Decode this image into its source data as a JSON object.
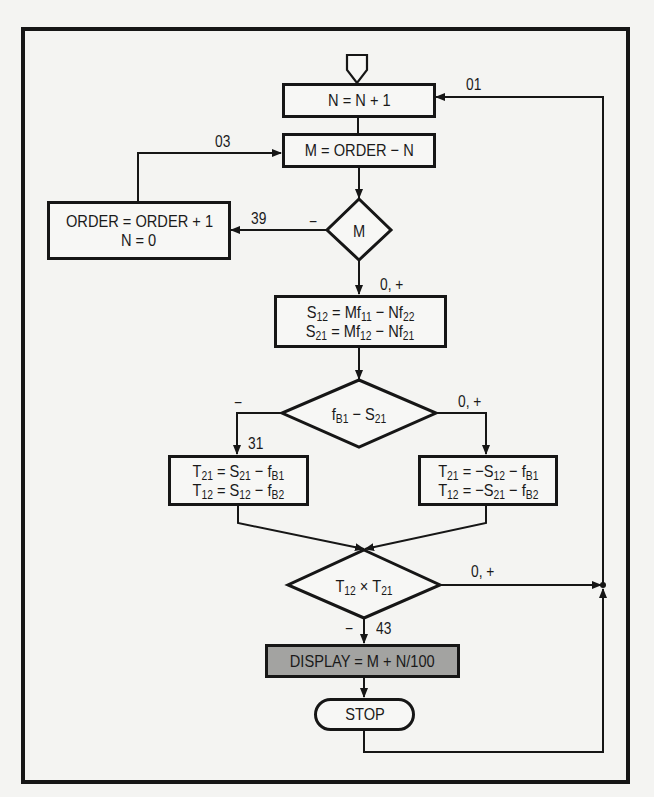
{
  "diagram": {
    "type": "flowchart",
    "nodes": {
      "start": {
        "shape": "offpage-connector"
      },
      "inc_n": {
        "text": "N = N + 1"
      },
      "calc_m": {
        "text": "M = ORDER − N"
      },
      "decide_m": {
        "text": "M"
      },
      "inc_order": {
        "line1": "ORDER = ORDER + 1",
        "line2": "N = 0"
      },
      "calc_s": {
        "line1": {
          "a": "S",
          "a_sub": "12",
          "eq": " = Mf",
          "b_sub": "11",
          "mid": " − Nf",
          "c_sub": "22"
        },
        "line2": {
          "a": "S",
          "a_sub": "21",
          "eq": " = Mf",
          "b_sub": "12",
          "mid": " − Nf",
          "c_sub": "21"
        }
      },
      "decide_f": {
        "a": "f",
        "a_sub": "B1",
        "mid": " − S",
        "b_sub": "21"
      },
      "calc_t_left": {
        "line1": {
          "a": "T",
          "a_sub": "21",
          "eq": " = S",
          "b_sub": "21",
          "mid": " − f",
          "c_sub": "B1"
        },
        "line2": {
          "a": "T",
          "a_sub": "12",
          "eq": " = S",
          "b_sub": "12",
          "mid": " − f",
          "c_sub": "B2"
        }
      },
      "calc_t_right": {
        "line1": {
          "a": "T",
          "a_sub": "21",
          "eq": " = −S",
          "b_sub": "12",
          "mid": " − f",
          "c_sub": "B1"
        },
        "line2": {
          "a": "T",
          "a_sub": "12",
          "eq": " = −S",
          "b_sub": "21",
          "mid": " − f",
          "c_sub": "B2"
        }
      },
      "decide_t": {
        "a": "T",
        "a_sub": "12",
        "mid": " × T",
        "b_sub": "21"
      },
      "display": {
        "text": "DISPLAY = M + N/100",
        "fill": "#a3a3a1"
      },
      "stop": {
        "text": "STOP"
      }
    },
    "labels": {
      "step_01": "01",
      "step_03": "03",
      "step_39": "39",
      "m_negative": "−",
      "m_zero_pos": "0, +",
      "f_negative": "−",
      "f_zero_pos": "0, +",
      "step_31": "31",
      "t_zero_pos": "0, +",
      "t_negative": "−",
      "step_43": "43"
    },
    "colors": {
      "line": "#161616",
      "background": "#f4f4f2",
      "display_fill": "#a3a3a1"
    }
  }
}
